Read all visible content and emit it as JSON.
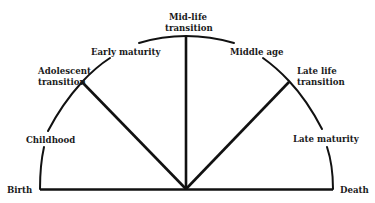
{
  "diagram": {
    "title": "",
    "line_color": "#111111",
    "text_color": "#1a1a1a",
    "endpoints": {
      "start": "Birth",
      "end": "Death"
    },
    "stages": [
      {
        "id": "childhood",
        "label": "Childhood",
        "type": "era"
      },
      {
        "id": "adolescent-transition",
        "label_lines": [
          "Adolescent",
          "transition"
        ],
        "type": "transition"
      },
      {
        "id": "early-maturity",
        "label": "Early maturity",
        "type": "era"
      },
      {
        "id": "mid-life-transition",
        "label_lines": [
          "Mid-life",
          "transition"
        ],
        "type": "transition"
      },
      {
        "id": "middle-age",
        "label": "Middle age",
        "type": "era"
      },
      {
        "id": "late-life-transition",
        "label_lines": [
          "Late life",
          "transition"
        ],
        "type": "transition"
      },
      {
        "id": "late-maturity",
        "label": "Late maturity",
        "type": "era"
      }
    ]
  }
}
